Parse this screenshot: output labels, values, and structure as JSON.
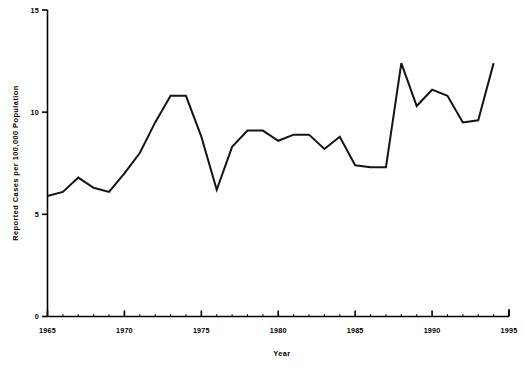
{
  "chart_data": {
    "type": "line",
    "title": "",
    "xlabel": "Year",
    "ylabel": "Reported Cases per 100,000 Population",
    "xlim": [
      1965,
      1995
    ],
    "ylim": [
      0,
      15
    ],
    "grid": false,
    "legend": null,
    "xticks": [
      1965,
      1970,
      1975,
      1980,
      1985,
      1990,
      1995
    ],
    "xtick_labels": [
      "1965",
      "1970",
      "1975",
      "1980",
      "1985",
      "1990",
      "1995"
    ],
    "yticks": [
      0,
      5,
      10,
      15
    ],
    "ytick_labels": [
      "0",
      "5",
      "10",
      "15"
    ],
    "series": [
      {
        "name": "Reported Cases per 100,000 Population",
        "color": "#141414",
        "x": [
          1965,
          1966,
          1967,
          1968,
          1969,
          1970,
          1971,
          1972,
          1973,
          1974,
          1975,
          1976,
          1977,
          1978,
          1979,
          1980,
          1981,
          1982,
          1983,
          1984,
          1985,
          1986,
          1987,
          1988,
          1989,
          1990,
          1991,
          1992,
          1993,
          1994
        ],
        "values": [
          5.9,
          6.1,
          6.8,
          6.3,
          6.1,
          7.0,
          8.0,
          9.5,
          10.8,
          10.8,
          8.8,
          6.2,
          8.3,
          9.1,
          9.1,
          8.6,
          8.9,
          8.9,
          8.2,
          8.8,
          7.4,
          7.3,
          7.3,
          12.4,
          10.3,
          11.1,
          10.8,
          9.5,
          9.6,
          12.4
        ]
      }
    ],
    "annotations": []
  },
  "axis_titles": {
    "x": "Year",
    "y": "Reported Cases per 100,000 Population"
  }
}
